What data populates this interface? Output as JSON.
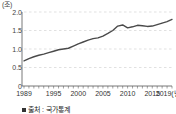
{
  "chart_data": {
    "type": "line",
    "title": "",
    "subtitle": "",
    "xlabel": "년",
    "ylabel": "조",
    "y_unit_label": "(조)",
    "x_unit_label": "(년)",
    "x_axis_last_label": "2019(년)",
    "grid": true,
    "grid_style": "dashed-horizontal",
    "legend": "none",
    "xlim": [
      1989,
      2019
    ],
    "ylim": [
      0,
      2.0
    ],
    "y_ticks": [
      "2.0",
      "1.5",
      "1.0",
      "0.5",
      "0"
    ],
    "y_tick_values": [
      2.0,
      1.5,
      1.0,
      0.5,
      0
    ],
    "x_ticks": [
      "1989",
      "1995",
      "2000",
      "2005",
      "2010",
      "2015",
      "2019"
    ],
    "x_tick_values": [
      1989,
      1995,
      2000,
      2005,
      2010,
      2015,
      2019
    ],
    "x_minor_tick_interval": 1,
    "line_color": "#4a4a4a",
    "grid_color": "#cccccc",
    "axis_color": "#555555",
    "x": [
      1989,
      1990,
      1991,
      1992,
      1993,
      1994,
      1995,
      1996,
      1997,
      1998,
      1999,
      2000,
      2001,
      2002,
      2003,
      2004,
      2005,
      2006,
      2007,
      2008,
      2009,
      2010,
      2011,
      2012,
      2013,
      2014,
      2015,
      2016,
      2017,
      2018,
      2019
    ],
    "values": [
      0.68,
      0.74,
      0.79,
      0.83,
      0.86,
      0.9,
      0.94,
      0.98,
      1.0,
      1.02,
      1.08,
      1.14,
      1.19,
      1.24,
      1.28,
      1.3,
      1.35,
      1.42,
      1.5,
      1.62,
      1.65,
      1.57,
      1.6,
      1.64,
      1.63,
      1.61,
      1.62,
      1.66,
      1.7,
      1.74,
      1.8
    ],
    "series": [
      {
        "name": "값",
        "values": [
          0.68,
          0.74,
          0.79,
          0.83,
          0.86,
          0.9,
          0.94,
          0.98,
          1.0,
          1.02,
          1.08,
          1.14,
          1.19,
          1.24,
          1.28,
          1.3,
          1.35,
          1.42,
          1.5,
          1.62,
          1.65,
          1.57,
          1.6,
          1.64,
          1.63,
          1.61,
          1.62,
          1.66,
          1.7,
          1.74,
          1.8
        ]
      }
    ]
  },
  "source": {
    "bullet": "■",
    "text": "출처 : 국가통계"
  }
}
